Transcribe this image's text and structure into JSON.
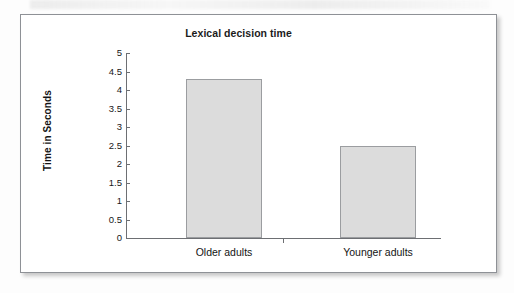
{
  "chart_data": {
    "type": "bar",
    "title": "Lexical decision time",
    "xlabel": "",
    "ylabel": "Time in Seconds",
    "categories": [
      "Older adults",
      "Younger adults"
    ],
    "values": [
      4.3,
      2.5
    ],
    "ylim": [
      0,
      5
    ],
    "y_ticks": [
      "5",
      "4.5",
      "4",
      "3.5",
      "3",
      "2.5",
      "2",
      "1.5",
      "1",
      "0.5",
      "0"
    ],
    "y_tick_values": [
      5,
      4.5,
      4,
      3.5,
      3,
      2.5,
      2,
      1.5,
      1,
      0.5,
      0
    ],
    "grid": false,
    "legend": false,
    "legend_position": "none",
    "bar_fill_color": "#dcdcdc",
    "bar_border_color": "#9b9da0",
    "axis_color": "#6d6f73",
    "frame_border_color": "#8e9196",
    "plot_background": "#ffffff"
  },
  "scan_artifacts": {
    "bleed_text_1": "Problems in Accessing Words",
    "bleed_text_2": "Finding Time"
  }
}
